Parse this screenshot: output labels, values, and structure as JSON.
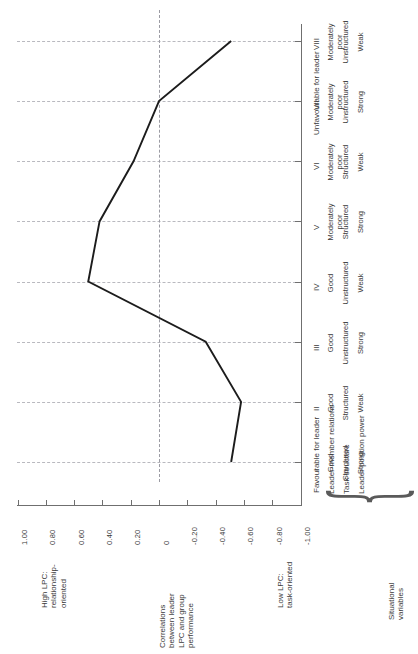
{
  "figure": {
    "value_axis": {
      "title_high": "High LPC:\nrelationship-\noriented",
      "title_low": "Low LPC:\ntask-oriented",
      "title_middle": "Correlations\nbetween leader\nLPC and group\nperformance",
      "ticks": [
        "1.00",
        "0.80",
        "0.60",
        "0.40",
        "0.20",
        "0",
        "-0.20",
        "-0.40",
        "-0.60",
        "-0.80",
        "-1.00"
      ],
      "range": [
        1.0,
        -1.0
      ]
    },
    "category_axis": {
      "octants": [
        "I",
        "II",
        "III",
        "IV",
        "V",
        "VI",
        "VII",
        "VIII"
      ],
      "favourable_label": "Favourable for leader",
      "unfavourable_label": "Unfavourable for leader"
    },
    "situational": {
      "group_label": "Situational\nvariables",
      "row_labels": [
        "Leader-member relations",
        "Task structure",
        "Leader position power"
      ],
      "rows": [
        [
          "Good",
          "Good",
          "Good",
          "Good",
          "Moderately\npoor",
          "Moderately\npoor",
          "Moderately\npoor",
          "Moderately\npoor"
        ],
        [
          "Structured",
          "Structured",
          "Unstructured",
          "Unstructured",
          "Structured",
          "Structured",
          "Unstructured",
          "Unstructured"
        ],
        [
          "Strong",
          "Weak",
          "Strong",
          "Weak",
          "Strong",
          "Weak",
          "Strong",
          "Weak"
        ]
      ]
    },
    "colors": {
      "line": "#1c1c1c",
      "grid": "#b9b9bf",
      "axis": "#6f6f6f",
      "text": "#3a3a3a",
      "background": "#ffffff"
    }
  },
  "chart_data": {
    "type": "line",
    "orientation": "horizontal-categories-vertical-axis-rotated",
    "title": "",
    "xlabel": "Situational favourableness (octant)",
    "ylabel": "Correlations between leader LPC and group performance",
    "categories": [
      "I",
      "II",
      "III",
      "IV",
      "V",
      "VI",
      "VII",
      "VIII"
    ],
    "values": [
      -0.51,
      -0.58,
      -0.33,
      0.5,
      0.42,
      0.18,
      0.0,
      -0.51
    ],
    "ylim": [
      -1.0,
      1.0
    ],
    "ytick_labels": [
      "1.00",
      "0.80",
      "0.60",
      "0.40",
      "0.20",
      "0",
      "-0.20",
      "-0.40",
      "-0.60",
      "-0.80",
      "-1.00"
    ],
    "grid": true,
    "legend": "none",
    "annotations": [
      "High LPC: relationship-oriented",
      "Low LPC: task-oriented",
      "Favourable for leader",
      "Unfavourable for leader"
    ]
  }
}
